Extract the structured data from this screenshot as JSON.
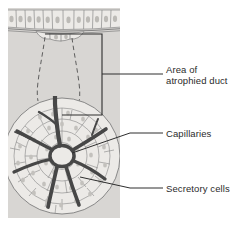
{
  "figure": {
    "panel": {
      "background_color": "#d8d6d3",
      "x": 8,
      "y": 8,
      "width": 112,
      "height": 210
    },
    "colors": {
      "panel_fill": "#d8d6d3",
      "cell_fill": "#eceae7",
      "cell_outline": "#8a8a8a",
      "nucleus": "#b9b7b3",
      "capillary": "#4a4a4a",
      "leader_line": "#3a3a3a",
      "bracket_line": "#2e2e2e",
      "dashed_duct": "#4a4a4a",
      "text": "#2b2b2b"
    },
    "labels": [
      {
        "id": "area-of-atrophied-duct",
        "line1": "Area of",
        "line2": "atrophied duct",
        "pointer": "bracket"
      },
      {
        "id": "capillaries",
        "line1": "Capillaries",
        "line2": "",
        "pointer": "leader"
      },
      {
        "id": "secretory-cells",
        "line1": "Secretory cells",
        "line2": "",
        "pointer": "leader"
      }
    ],
    "structures": {
      "epithelium": {
        "name": "columnar epithelium",
        "cell_count": 12
      },
      "duct": {
        "name": "atrophied duct outline",
        "style": "dashed"
      },
      "acinus": {
        "name": "gland acinus",
        "secretory_cell_count": 60,
        "capillary_branches": 7
      }
    }
  }
}
